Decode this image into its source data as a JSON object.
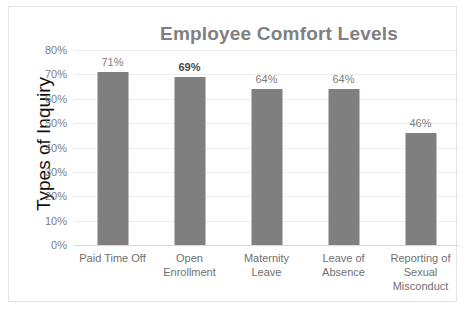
{
  "chart_data": {
    "type": "bar",
    "title": "Employee Comfort Levels",
    "xlabel": "",
    "ylabel": "Types of Inquiry",
    "categories": [
      "Paid Time Off",
      "Open Enrollment",
      "Maternity Leave",
      "Leave of Absence",
      "Reporting of Sexual Misconduct"
    ],
    "values": [
      71,
      69,
      64,
      64,
      46
    ],
    "data_labels": [
      "71%",
      "69%",
      "64%",
      "64%",
      "46%"
    ],
    "emphasized_labels": [
      "69%"
    ],
    "ylim": [
      0,
      80
    ],
    "ytick_values": [
      0,
      10,
      20,
      30,
      40,
      50,
      60,
      70,
      80
    ],
    "ytick_labels": [
      "0%",
      "10%",
      "20%",
      "30%",
      "40%",
      "50%",
      "60%",
      "70%",
      "80%"
    ],
    "grid": true,
    "legend": false,
    "bar_color": "#7f7f7f",
    "title_color": "#808080",
    "gridline_color": "#ededed",
    "axis_line_color": "#d9d9d9",
    "tick_label_color": "#7d7d7d",
    "axis_title_color": "#111111"
  }
}
